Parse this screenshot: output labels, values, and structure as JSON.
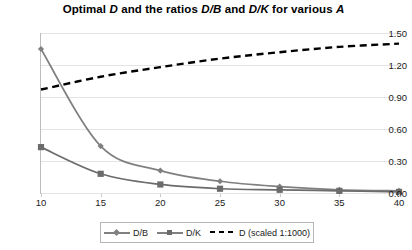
{
  "chart_data": {
    "type": "line",
    "title": "Optimal D and the ratios D/B and D/K for various A",
    "title_parts": [
      {
        "text": "Optimal ",
        "italic": false
      },
      {
        "text": "D",
        "italic": true
      },
      {
        "text": " and the ratios ",
        "italic": false
      },
      {
        "text": "D/B",
        "italic": true
      },
      {
        "text": " and ",
        "italic": false
      },
      {
        "text": "D/K",
        "italic": true
      },
      {
        "text": " for various ",
        "italic": false
      },
      {
        "text": "A",
        "italic": true
      }
    ],
    "xlabel": "",
    "ylabel": "",
    "x": [
      10,
      15,
      20,
      25,
      30,
      35,
      40
    ],
    "xtick_labels": [
      "10",
      "15",
      "20",
      "25",
      "30",
      "35",
      "40"
    ],
    "ytick_labels": [
      "0.00",
      "0.30",
      "0.60",
      "0.90",
      "1.20",
      "1.50"
    ],
    "ytick_values": [
      0.0,
      0.3,
      0.6,
      0.9,
      1.2,
      1.5
    ],
    "xlim": [
      10,
      40
    ],
    "ylim": [
      0.0,
      1.5
    ],
    "grid": true,
    "legend_position": "bottom",
    "series": [
      {
        "name": "D/B",
        "values": [
          1.35,
          0.44,
          0.21,
          0.11,
          0.06,
          0.03,
          0.02
        ],
        "color": "#808080",
        "marker": "diamond",
        "style": "solid"
      },
      {
        "name": "D/K",
        "values": [
          0.43,
          0.18,
          0.08,
          0.04,
          0.03,
          0.02,
          0.01
        ],
        "color": "#6b6b6b",
        "marker": "square",
        "style": "solid"
      },
      {
        "name": "D (scaled 1:1000)",
        "values": [
          0.97,
          1.09,
          1.18,
          1.26,
          1.32,
          1.37,
          1.4
        ],
        "color": "#000000",
        "marker": "none",
        "style": "dashed"
      }
    ]
  },
  "legend": {
    "items": [
      {
        "label": "D/B"
      },
      {
        "label": "D/K"
      },
      {
        "label": "D (scaled 1:1000)"
      }
    ]
  }
}
